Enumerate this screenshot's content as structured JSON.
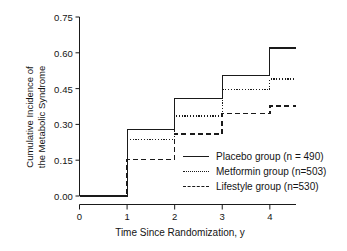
{
  "chart_data": {
    "type": "line",
    "title": "",
    "xlabel": "Time Since Randomization, y",
    "ylabel_line1": "Cumulative Incidence of",
    "ylabel_line2": "the Metabolic Syndrome",
    "xlim": [
      0,
      4.55
    ],
    "ylim": [
      0.0,
      0.75
    ],
    "xticks": [
      0,
      1,
      2,
      3,
      4
    ],
    "xtick_labels": [
      "0",
      "1",
      "2",
      "3",
      "4"
    ],
    "yticks": [
      0.0,
      0.15,
      0.3,
      0.45,
      0.6,
      0.75
    ],
    "ytick_labels": [
      "0.00",
      "0.15",
      "0.30",
      "0.45",
      "0.60",
      "0.75"
    ],
    "grid": false,
    "legend_position": "center-right",
    "step_type": "post",
    "x": [
      0,
      1,
      2,
      3,
      4,
      4.55
    ],
    "series": [
      {
        "name": "Placebo group (n = 490)",
        "style": "solid",
        "color": "#1a1a1a",
        "values": [
          0.0,
          0.28,
          0.41,
          0.505,
          0.62,
          0.62
        ]
      },
      {
        "name": "Metformin group (n=503)",
        "style": "dotted",
        "color": "#1a1a1a",
        "values": [
          0.0,
          0.235,
          0.335,
          0.445,
          0.49,
          0.49
        ]
      },
      {
        "name": "Lifestyle group (n=530)",
        "style": "dashed",
        "color": "#1a1a1a",
        "values": [
          0.0,
          0.153,
          0.26,
          0.345,
          0.378,
          0.378
        ]
      }
    ]
  },
  "legend": {
    "items": [
      {
        "label": "Placebo group (n = 490)",
        "style": "solid"
      },
      {
        "label": "Metformin group (n=503)",
        "style": "dotted"
      },
      {
        "label": "Lifestyle group (n=530)",
        "style": "dashed"
      }
    ]
  },
  "colors": {
    "line": "#1a1a1a",
    "axis": "#1a1a1a",
    "background": "#ffffff"
  }
}
